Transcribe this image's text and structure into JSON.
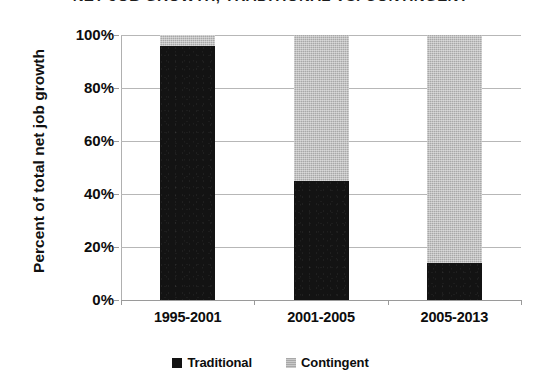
{
  "chart_data": {
    "type": "bar",
    "title": "NET JOB GROWTH, TRADITIONAL VS. CONTINGENT",
    "xlabel": "",
    "ylabel": "Percent of total net job growth",
    "categories": [
      "1995-2001",
      "2001-2005",
      "2005-2013"
    ],
    "series": [
      {
        "name": "Traditional",
        "color": "#131313",
        "values": [
          96,
          45,
          14
        ]
      },
      {
        "name": "Contingent",
        "color": "#a8a8a8",
        "values": [
          4,
          55,
          86
        ]
      }
    ],
    "stacked": true,
    "ylim": [
      0,
      100
    ],
    "ytick_labels": [
      "100%",
      "80%",
      "60%",
      "40%",
      "20%",
      "0%"
    ],
    "ytick_values": [
      100,
      80,
      60,
      40,
      20,
      0
    ],
    "grid": true,
    "legend_position": "bottom"
  },
  "legend": {
    "items": [
      {
        "label": "Traditional"
      },
      {
        "label": "Contingent"
      }
    ]
  }
}
